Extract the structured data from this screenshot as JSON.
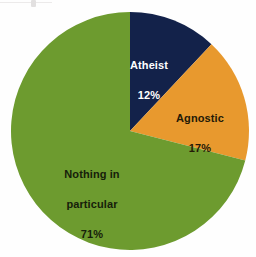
{
  "chart_data": {
    "type": "pie",
    "title": "",
    "subtitle": "",
    "xlabel": "",
    "ylabel": "",
    "legend_position": "none",
    "grid": false,
    "value_unit": "%",
    "start_angle_deg": 0,
    "direction": "clockwise",
    "categories": [
      "Atheist",
      "Agnostic",
      "Nothing in particular"
    ],
    "values": [
      12,
      17,
      71
    ],
    "colors": [
      "#13224a",
      "#e8992e",
      "#6d9b2f"
    ],
    "slices": [
      {
        "label": "Atheist",
        "value": 12,
        "value_label": "12%",
        "color": "#13224a",
        "label_color": "#ffffff",
        "start_deg": 0,
        "end_deg": 43.2
      },
      {
        "label": "Agnostic",
        "value": 17,
        "value_label": "17%",
        "color": "#e8992e",
        "label_color": "#241a07",
        "start_deg": 43.2,
        "end_deg": 104.4
      },
      {
        "label": "Nothing in particular",
        "label_line1": "Nothing in",
        "label_line2": "particular",
        "value": 71,
        "value_label": "71%",
        "color": "#6d9b2f",
        "label_color": "#16200a",
        "start_deg": 104.4,
        "end_deg": 360
      }
    ]
  },
  "figure": {
    "background": "#fefefe",
    "center_x": 130,
    "center_y": 131,
    "radius": 119
  }
}
